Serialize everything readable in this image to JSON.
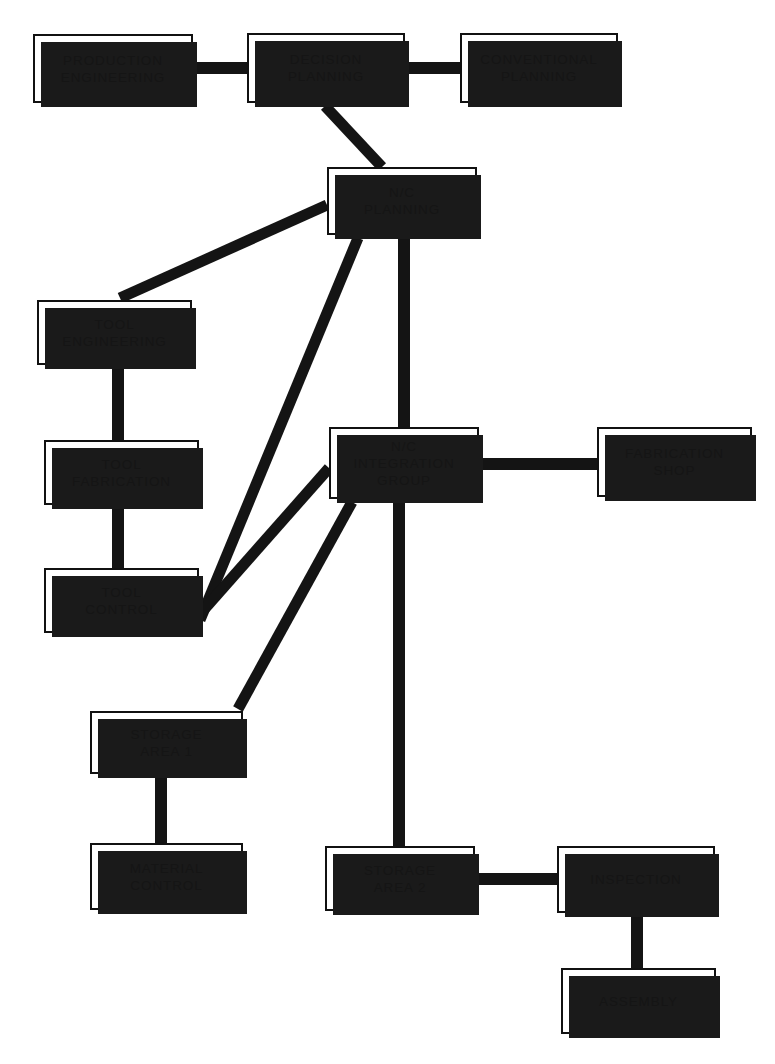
{
  "diagram": {
    "type": "organizational-flow",
    "canvas": {
      "width": 775,
      "height": 1064
    },
    "style": {
      "background_color": "#ffffff",
      "box_fill": "#ffffff",
      "box_border_color": "#111111",
      "shadow_color": "#1a1a1a",
      "connector_color": "#141414",
      "text_color": "#151515"
    },
    "nodes": [
      {
        "id": "production-engineering",
        "label": "PRODUCTION\nENGINEERING",
        "x": 33,
        "y": 34,
        "width": 160,
        "height": 69
      },
      {
        "id": "decision-planning",
        "label": "DECISION\nPLANNING",
        "x": 247,
        "y": 33,
        "width": 158,
        "height": 70
      },
      {
        "id": "conventional-planning",
        "label": "CONVENTIONAL\nPLANNING",
        "x": 460,
        "y": 33,
        "width": 158,
        "height": 70
      },
      {
        "id": "nc-planning",
        "label": "N/C\nPLANNING",
        "x": 327,
        "y": 167,
        "width": 150,
        "height": 68
      },
      {
        "id": "tool-engineering",
        "label": "TOOL\nENGINEERING",
        "x": 37,
        "y": 300,
        "width": 155,
        "height": 65
      },
      {
        "id": "tool-fabrication",
        "label": "TOOL\nFABRICATION",
        "x": 44,
        "y": 440,
        "width": 155,
        "height": 65
      },
      {
        "id": "tool-control",
        "label": "TOOL\nCONTROL",
        "x": 44,
        "y": 568,
        "width": 155,
        "height": 65
      },
      {
        "id": "nc-integration-group",
        "label": "N/C\nINTEGRATION\nGROUP",
        "x": 329,
        "y": 427,
        "width": 150,
        "height": 72
      },
      {
        "id": "fabrication-shop",
        "label": "FABRICATION\nSHOP",
        "x": 597,
        "y": 427,
        "width": 155,
        "height": 70
      },
      {
        "id": "storage-area-1",
        "label": "STORAGE\nAREA 1",
        "x": 90,
        "y": 711,
        "width": 153,
        "height": 63
      },
      {
        "id": "material-control",
        "label": "MATERIAL\nCONTROL",
        "x": 90,
        "y": 843,
        "width": 153,
        "height": 67
      },
      {
        "id": "storage-area-2",
        "label": "STORAGE\nAREA 2",
        "x": 325,
        "y": 846,
        "width": 150,
        "height": 65
      },
      {
        "id": "inspection",
        "label": "INSPECTION",
        "x": 557,
        "y": 846,
        "width": 158,
        "height": 67
      },
      {
        "id": "assembly",
        "label": "ASSEMBLY",
        "x": 561,
        "y": 968,
        "width": 155,
        "height": 66
      }
    ],
    "connectors": [
      {
        "id": "production-engineering-to-decision-planning",
        "from": "production-engineering",
        "to": "decision-planning",
        "orientation": "horizontal",
        "x1": 193,
        "y1": 68,
        "x2": 247,
        "y2": 68
      },
      {
        "id": "decision-planning-to-conventional-planning",
        "from": "decision-planning",
        "to": "conventional-planning",
        "orientation": "horizontal",
        "x1": 405,
        "y1": 68,
        "x2": 460,
        "y2": 68
      },
      {
        "id": "decision-planning-to-nc-planning",
        "from": "decision-planning",
        "to": "nc-planning",
        "orientation": "diagonal",
        "x1": 325,
        "y1": 106,
        "x2": 382,
        "y2": 167
      },
      {
        "id": "nc-planning-to-tool-engineering",
        "from": "nc-planning",
        "to": "tool-engineering",
        "orientation": "diagonal",
        "x1": 327,
        "y1": 205,
        "x2": 120,
        "y2": 298
      },
      {
        "id": "nc-planning-to-tool-control",
        "from": "nc-planning",
        "to": "tool-control",
        "orientation": "diagonal",
        "x1": 358,
        "y1": 238,
        "x2": 200,
        "y2": 620
      },
      {
        "id": "nc-planning-to-nc-integration-group",
        "from": "nc-planning",
        "to": "nc-integration-group",
        "orientation": "vertical",
        "x1": 404,
        "y1": 238,
        "x2": 404,
        "y2": 427
      },
      {
        "id": "nc-integration-group-to-tool-control",
        "from": "nc-integration-group",
        "to": "tool-control",
        "orientation": "diagonal",
        "x1": 329,
        "y1": 468,
        "x2": 200,
        "y2": 614
      },
      {
        "id": "nc-integration-group-to-fabrication-shop",
        "from": "nc-integration-group",
        "to": "fabrication-shop",
        "orientation": "horizontal",
        "x1": 479,
        "y1": 464,
        "x2": 597,
        "y2": 464
      },
      {
        "id": "nc-integration-group-to-storage-area-1",
        "from": "nc-integration-group",
        "to": "storage-area-1",
        "orientation": "diagonal",
        "x1": 352,
        "y1": 502,
        "x2": 238,
        "y2": 709
      },
      {
        "id": "nc-integration-group-to-storage-area-2",
        "from": "nc-integration-group",
        "to": "storage-area-2",
        "orientation": "vertical",
        "x1": 399,
        "y1": 502,
        "x2": 399,
        "y2": 846
      },
      {
        "id": "tool-engineering-to-tool-fabrication",
        "from": "tool-engineering",
        "to": "tool-fabrication",
        "orientation": "vertical",
        "x1": 118,
        "y1": 365,
        "x2": 118,
        "y2": 440
      },
      {
        "id": "tool-fabrication-to-tool-control",
        "from": "tool-fabrication",
        "to": "tool-control",
        "orientation": "vertical",
        "x1": 118,
        "y1": 505,
        "x2": 118,
        "y2": 568
      },
      {
        "id": "storage-area-1-to-material-control",
        "from": "storage-area-1",
        "to": "material-control",
        "orientation": "vertical",
        "x1": 161,
        "y1": 774,
        "x2": 161,
        "y2": 843
      },
      {
        "id": "storage-area-2-to-inspection",
        "from": "storage-area-2",
        "to": "inspection",
        "orientation": "horizontal",
        "x1": 475,
        "y1": 879,
        "x2": 557,
        "y2": 879
      },
      {
        "id": "inspection-to-assembly",
        "from": "inspection",
        "to": "assembly",
        "orientation": "vertical",
        "x1": 637,
        "y1": 913,
        "x2": 637,
        "y2": 968
      }
    ]
  }
}
